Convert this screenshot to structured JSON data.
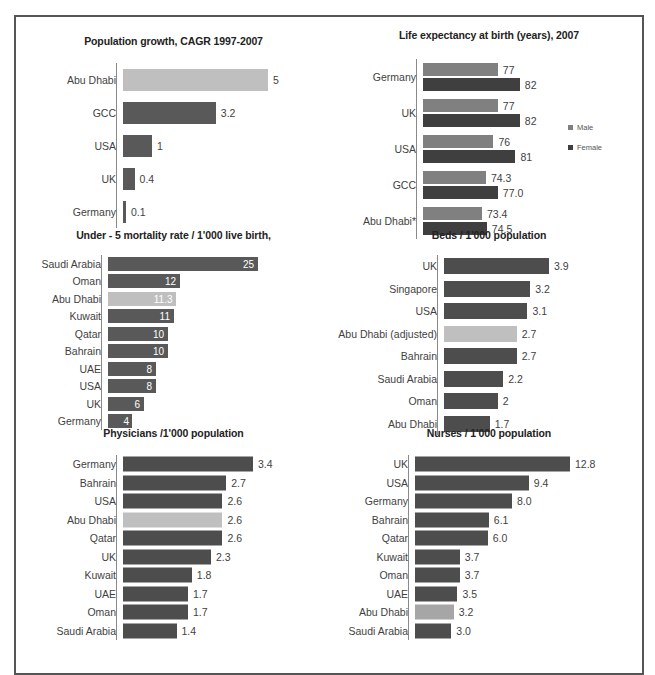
{
  "chart_data": [
    {
      "id": "population_growth",
      "type": "bar",
      "orientation": "horizontal",
      "title": "Population growth, CAGR 1997-2007",
      "xlabel": "",
      "ylabel": "",
      "grid": false,
      "legend": "none",
      "label_position": "outside-end",
      "max": 5,
      "categories": [
        "Abu Dhabi",
        "GCC",
        "USA",
        "UK",
        "Germany"
      ],
      "values": [
        5,
        3.2,
        1,
        0.4,
        0.1
      ],
      "value_labels": [
        "5",
        "3.2",
        "1",
        "0.4",
        "0.1"
      ],
      "highlight_index": 0,
      "colors": {
        "bar": "#595959",
        "highlight": "#bfbfbf"
      }
    },
    {
      "id": "life_expectancy",
      "type": "bar",
      "orientation": "horizontal",
      "title": "Life expectancy at birth (years), 2007",
      "xlabel": "",
      "ylabel": "",
      "grid": false,
      "legend": "right",
      "label_position": "outside-end",
      "axis_min": 60,
      "axis_max": 85,
      "categories": [
        "Germany",
        "UK",
        "USA",
        "GCC",
        "Abu Dhabi*"
      ],
      "series": [
        {
          "name": "Male",
          "values": [
            77,
            77,
            76,
            74.3,
            73.4
          ],
          "value_labels": [
            "77",
            "77",
            "76",
            "74.3",
            "73.4"
          ],
          "color": "#808080"
        },
        {
          "name": "Female",
          "values": [
            82,
            82,
            81,
            77.0,
            74.5
          ],
          "value_labels": [
            "82",
            "82",
            "81",
            "77.0",
            "74.5"
          ],
          "color": "#3f3f3f"
        }
      ],
      "legend_entries": [
        "Male",
        "Female"
      ]
    },
    {
      "id": "under5_mortality",
      "type": "bar",
      "orientation": "horizontal",
      "title": "Under - 5 mortality rate / 1'000 live birth,",
      "xlabel": "",
      "ylabel": "",
      "grid": false,
      "legend": "none",
      "label_position": "inside-end",
      "max": 25,
      "categories": [
        "Saudi Arabia",
        "Oman",
        "Abu Dhabi",
        "Kuwait",
        "Qatar",
        "Bahrain",
        "UAE",
        "USA",
        "UK",
        "Germany"
      ],
      "values": [
        25,
        12,
        11.3,
        11,
        10,
        10,
        8,
        8,
        6,
        4
      ],
      "value_labels": [
        "25",
        "12",
        "11.3",
        "11",
        "10",
        "10",
        "8",
        "8",
        "6",
        "4"
      ],
      "highlight_index": 2,
      "colors": {
        "bar": "#595959",
        "highlight": "#bfbfbf"
      }
    },
    {
      "id": "beds_per_1000",
      "type": "bar",
      "orientation": "horizontal",
      "title": "Beds / 1'000 population",
      "xlabel": "",
      "ylabel": "",
      "grid": false,
      "legend": "none",
      "label_position": "outside-end",
      "max": 3.9,
      "categories": [
        "UK",
        "Singapore",
        "USA",
        "Abu Dhabi (adjusted)",
        "Bahrain",
        "Saudi Arabia",
        "Oman",
        "Abu Dhabi"
      ],
      "values": [
        3.9,
        3.2,
        3.1,
        2.7,
        2.7,
        2.2,
        2,
        1.7
      ],
      "value_labels": [
        "3.9",
        "3.2",
        "3.1",
        "2.7",
        "2.7",
        "2.2",
        "2",
        "1.7"
      ],
      "highlight_index": 3,
      "colors": {
        "bar": "#4d4d4d",
        "highlight": "#bfbfbf"
      }
    },
    {
      "id": "physicians_per_1000",
      "type": "bar",
      "orientation": "horizontal",
      "title": "Physicians /1'000 population",
      "xlabel": "",
      "ylabel": "",
      "grid": false,
      "legend": "none",
      "label_position": "outside-end",
      "max": 3.4,
      "categories": [
        "Germany",
        "Bahrain",
        "USA",
        "Abu Dhabi",
        "Qatar",
        "UK",
        "Kuwait",
        "UAE",
        "Oman",
        "Saudi Arabia"
      ],
      "values": [
        3.4,
        2.7,
        2.6,
        2.6,
        2.6,
        2.3,
        1.8,
        1.7,
        1.7,
        1.4
      ],
      "value_labels": [
        "3.4",
        "2.7",
        "2.6",
        "2.6",
        "2.6",
        "2.3",
        "1.8",
        "1.7",
        "1.7",
        "1.4"
      ],
      "highlight_index": 3,
      "colors": {
        "bar": "#4d4d4d",
        "highlight": "#bfbfbf"
      }
    },
    {
      "id": "nurses_per_1000",
      "type": "bar",
      "orientation": "horizontal",
      "title": "Nurses / 1'000 population",
      "xlabel": "",
      "ylabel": "",
      "grid": false,
      "legend": "none",
      "label_position": "outside-end",
      "max": 12.8,
      "categories": [
        "UK",
        "USA",
        "Germany",
        "Bahrain",
        "Qatar",
        "Kuwait",
        "Oman",
        "UAE",
        "Abu Dhabi",
        "Saudi Arabia"
      ],
      "values": [
        12.8,
        9.4,
        8.0,
        6.1,
        6.0,
        3.7,
        3.7,
        3.5,
        3.2,
        3.0
      ],
      "value_labels": [
        "12.8",
        "9.4",
        "8.0",
        "6.1",
        "6.0",
        "3.7",
        "3.7",
        "3.5",
        "3.2",
        "3.0"
      ],
      "highlight_index": 8,
      "colors": {
        "bar": "#4d4d4d",
        "highlight": "#a6a6a6"
      }
    }
  ]
}
